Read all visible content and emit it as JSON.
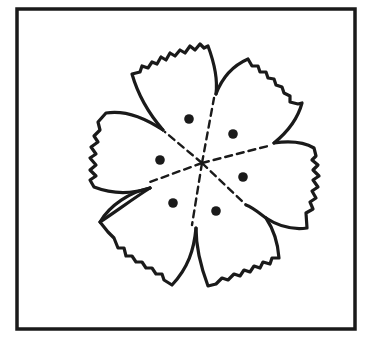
{
  "figure": {
    "type": "line-drawing",
    "petal_count": 5,
    "dot_count": 7,
    "colors": {
      "ink": "#1a1a1a",
      "background": "#ffffff"
    }
  }
}
